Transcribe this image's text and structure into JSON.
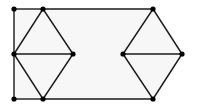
{
  "diagram": {
    "type": "graph",
    "colors": {
      "edge": "#1a1a1a",
      "node": "#000000",
      "region_fill": "#f7f7f7",
      "background": "#ffffff"
    },
    "nodes": [
      {
        "id": "A",
        "x": 14,
        "y": 9
      },
      {
        "id": "B",
        "x": 43,
        "y": 9
      },
      {
        "id": "C",
        "x": 14,
        "y": 54
      },
      {
        "id": "D",
        "x": 73,
        "y": 54
      },
      {
        "id": "E",
        "x": 14,
        "y": 99
      },
      {
        "id": "F",
        "x": 43,
        "y": 99
      },
      {
        "id": "G",
        "x": 153,
        "y": 9
      },
      {
        "id": "H",
        "x": 123,
        "y": 54
      },
      {
        "id": "I",
        "x": 182,
        "y": 54
      },
      {
        "id": "J",
        "x": 153,
        "y": 99
      }
    ],
    "edges": [
      [
        "A",
        "B"
      ],
      [
        "A",
        "C"
      ],
      [
        "C",
        "E"
      ],
      [
        "E",
        "F"
      ],
      [
        "B",
        "C"
      ],
      [
        "B",
        "D"
      ],
      [
        "C",
        "D"
      ],
      [
        "C",
        "F"
      ],
      [
        "D",
        "F"
      ],
      [
        "B",
        "G"
      ],
      [
        "F",
        "J"
      ],
      [
        "G",
        "H"
      ],
      [
        "G",
        "I"
      ],
      [
        "H",
        "I"
      ],
      [
        "H",
        "J"
      ],
      [
        "I",
        "J"
      ]
    ]
  }
}
